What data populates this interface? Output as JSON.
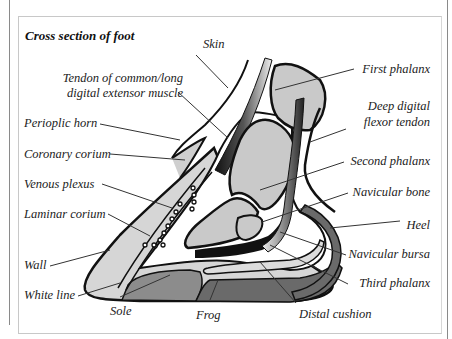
{
  "figure": {
    "title": "Cross section of foot"
  },
  "labels": {
    "skin": "Skin",
    "tendon_extensor_line1": "Tendon of common/long",
    "tendon_extensor_line2": "digital extensor muscle",
    "perioplic_horn": "Perioplic horn",
    "coronary_corium": "Coronary corium",
    "venous_plexus": "Venous plexus",
    "laminar_corium": "Laminar corium",
    "wall": "Wall",
    "white_line": "White line",
    "sole": "Sole",
    "frog": "Frog",
    "distal_cushion": "Distal cushion",
    "third_phalanx": "Third phalanx",
    "navicular_bursa": "Navicular bursa",
    "heel": "Heel",
    "navicular_bone": "Navicular bone",
    "second_phalanx": "Second phalanx",
    "deep_flexor_line1": "Deep digital",
    "deep_flexor_line2": "flexor tendon",
    "first_phalanx": "First phalanx"
  },
  "colors": {
    "bone": "#c9c9c9",
    "wall": "#d6d6d6",
    "sole": "#8c8c8c",
    "frog": "#6a6a6a",
    "outline": "#111111",
    "leader": "#333333"
  }
}
